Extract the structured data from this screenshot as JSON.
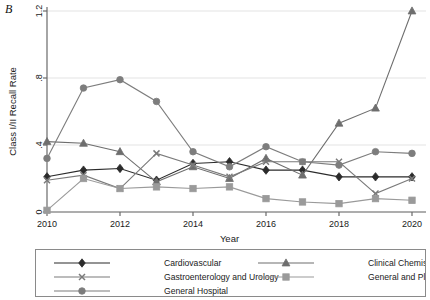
{
  "panel": {
    "label": "B"
  },
  "chart_data": {
    "type": "line",
    "title": "",
    "xlabel": "Year",
    "ylabel": "Class I/II Recall Rate",
    "x": [
      2010,
      2011,
      2012,
      2013,
      2014,
      2015,
      2016,
      2017,
      2018,
      2019,
      2020
    ],
    "xlim": [
      2010,
      2020
    ],
    "ylim": [
      0,
      1.25
    ],
    "xticks": [
      2010,
      2012,
      2014,
      2016,
      2018,
      2020
    ],
    "xtick_labels": [
      "2010",
      "2012",
      "2014",
      "2016",
      "2018",
      "2020"
    ],
    "yticks": [
      0,
      0.4,
      0.8,
      1.2
    ],
    "ytick_labels": [
      "0",
      ".4",
      ".8",
      "1.2"
    ],
    "grid": "horizontal",
    "legend_position": "below",
    "series": [
      {
        "name": "Cardiovascular",
        "marker": "diamond",
        "color": "#2b2b2b",
        "values": [
          0.21,
          0.25,
          0.26,
          0.19,
          0.29,
          0.3,
          0.25,
          0.25,
          0.21,
          0.21,
          0.21
        ]
      },
      {
        "name": "Clinical Chemistry",
        "marker": "triangle",
        "color": "#6e6e6e",
        "values": [
          0.42,
          0.41,
          0.36,
          0.18,
          0.27,
          0.2,
          0.32,
          0.22,
          0.53,
          0.62,
          1.2
        ]
      },
      {
        "name": "Gastroenterology and Urology",
        "marker": "x",
        "color": "#7a7a7a",
        "values": [
          0.19,
          0.22,
          0.14,
          0.35,
          0.28,
          0.21,
          0.3,
          0.3,
          0.3,
          0.11,
          0.2
        ]
      },
      {
        "name": "General and Plastic Surgey",
        "marker": "square",
        "color": "#9a9a9a",
        "values": [
          0.01,
          0.2,
          0.14,
          0.15,
          0.14,
          0.15,
          0.08,
          0.06,
          0.05,
          0.08,
          0.07
        ]
      },
      {
        "name": "General Hospital",
        "marker": "circle",
        "color": "#7d7d7d",
        "values": [
          0.32,
          0.74,
          0.79,
          0.66,
          0.36,
          0.27,
          0.39,
          0.3,
          0.28,
          0.36,
          0.35
        ]
      }
    ]
  },
  "legend": {
    "entries": [
      {
        "label": "Cardiovascular",
        "marker": "diamond",
        "color": "#2b2b2b"
      },
      {
        "label": "Clinical Chemistry",
        "marker": "triangle",
        "color": "#6e6e6e"
      },
      {
        "label": "Gastroenterology and Urology",
        "marker": "x",
        "color": "#7a7a7a"
      },
      {
        "label": "General and Plastic Surgey",
        "marker": "square",
        "color": "#9a9a9a"
      },
      {
        "label": "General Hospital",
        "marker": "circle",
        "color": "#7d7d7d"
      }
    ]
  },
  "colors": {
    "axis": "#6a6a6a",
    "grid": "#e3e3e3",
    "text": "#1a1a1a",
    "legend_border": "#8a8a8a",
    "background": "#ffffff"
  }
}
